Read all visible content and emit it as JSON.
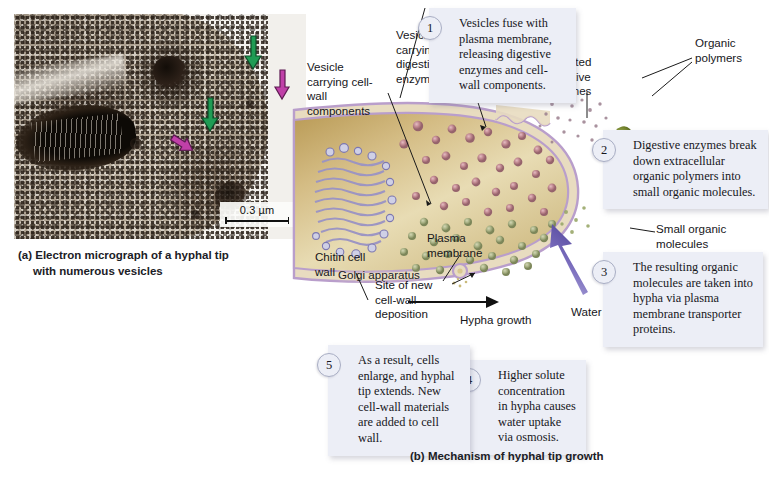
{
  "figure": {
    "panel_a": {
      "tag": "(a)",
      "caption_line1": "(a) Electron micrograph of a hyphal tip",
      "caption_line2": "with numerous vesicles",
      "scale_bar_label": "0.3 µm"
    },
    "panel_b": {
      "tag": "(b)",
      "caption": "(b) Mechanism of hyphal tip growth"
    }
  },
  "steps": [
    {
      "number": "1",
      "text": "Vesicles fuse with plasma membrane, releasing digestive enzymes and cell-wall components."
    },
    {
      "number": "2",
      "text": "Digestive enzymes break down extracellular organic polymers into small organic molecules."
    },
    {
      "number": "3",
      "text": "The resulting organic molecules are taken into hypha via plasma membrane transporter proteins."
    },
    {
      "number": "4",
      "text": "Higher solute concentration in hypha causes water uptake via osmosis."
    },
    {
      "number": "5",
      "text": "As a result, cells enlarge, and hyphal tip extends. New cell-wall materials are added to cell wall."
    }
  ],
  "labels": {
    "vesicle_cell_wall": "Vesicle carrying cell-wall components",
    "vesicle_digestive": "Vesicle carrying digestive enzymes",
    "secreted_enzymes": "Secreted digestive enzymes",
    "organic_polymers": "Organic polymers",
    "small_organic_molecules": "Small organic molecules",
    "golgi": "Golgi apparatus",
    "chitin_cell_wall": "Chitin cell wall",
    "plasma_membrane": "Plasma membrane",
    "site_of_deposition": "Site of new cell-wall deposition",
    "hypha_growth": "Hypha growth",
    "water": "Water"
  },
  "colors": {
    "step_box_bg": "#eceef6",
    "cytoplasm_tan": "#d9c48d",
    "cell_wall_lavender": "#cdb6d6",
    "vesicle_pink": "#c08a96",
    "vesicle_green": "#a9b184",
    "organic_polymer_green": "#7d8c3c",
    "water_arrow_purple": "#6f63b4",
    "micrograph_arrow_green": "#1f9c54",
    "micrograph_arrow_magenta": "#c040a8"
  }
}
